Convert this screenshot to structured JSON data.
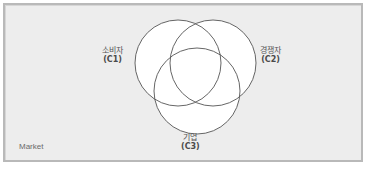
{
  "diagram": {
    "type": "venn",
    "container_label": "Market",
    "sets": [
      {
        "id": "C1",
        "name": "소비자",
        "code": "(C1)",
        "position": "top-left"
      },
      {
        "id": "C2",
        "name": "경쟁자",
        "code": "(C2)",
        "position": "top-right"
      },
      {
        "id": "C3",
        "name": "기업",
        "code": "(C3)",
        "position": "bottom"
      }
    ],
    "colors": {
      "background": "#ededed",
      "circle_fill": "#ffffff",
      "circle_stroke": "#555555",
      "border": "#b9b9b9"
    }
  }
}
